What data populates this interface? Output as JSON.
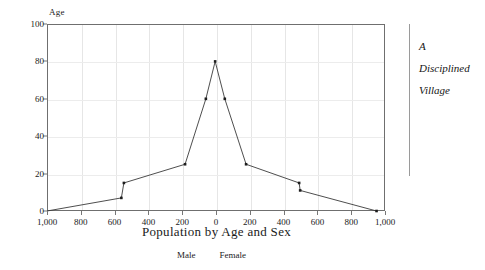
{
  "chart_data": {
    "type": "line",
    "title": "",
    "subtitle": "",
    "xlabel": "Population by Age and Sex",
    "ylabel": "Age",
    "xlim": [
      -1000,
      1000
    ],
    "ylim": [
      0,
      100
    ],
    "grid": true,
    "x_ticks": [
      -1000,
      -800,
      -600,
      -400,
      -200,
      0,
      200,
      400,
      600,
      800,
      1000
    ],
    "x_tick_labels": [
      "1,000",
      "800",
      "600",
      "400",
      "200",
      "0",
      "200",
      "400",
      "600",
      "800",
      "1,000"
    ],
    "y_ticks": [
      0,
      20,
      40,
      60,
      80,
      100
    ],
    "y_tick_labels": [
      "0",
      "20",
      "40",
      "60",
      "80",
      "100"
    ],
    "legend_position": "below",
    "legend": [
      "Male",
      "Female"
    ],
    "series": [
      {
        "name": "Population by Age and Sex",
        "points": [
          {
            "x": -1000,
            "y": 0
          },
          {
            "x": -560,
            "y": 7
          },
          {
            "x": -545,
            "y": 15
          },
          {
            "x": -183,
            "y": 25
          },
          {
            "x": -60,
            "y": 60
          },
          {
            "x": -5,
            "y": 80
          },
          {
            "x": 52,
            "y": 60
          },
          {
            "x": 178,
            "y": 25
          },
          {
            "x": 492,
            "y": 15
          },
          {
            "x": 498,
            "y": 11
          },
          {
            "x": 950,
            "y": 0
          }
        ]
      }
    ],
    "annotations": [
      {
        "text": "A",
        "position": "right-margin"
      },
      {
        "text": "Disciplined",
        "position": "right-margin"
      },
      {
        "text": "Village",
        "position": "right-margin"
      }
    ],
    "colors": {
      "line": "#3a3a3a",
      "marker": "#1d1d1d",
      "frame": "#6f6f6f",
      "grid": "#e6e6e6",
      "background": "#ffffff",
      "text": "#1a1a1a",
      "rule": "#9a9a9a"
    }
  },
  "side_note": {
    "lines": [
      "A",
      "Disciplined",
      "Village"
    ]
  }
}
